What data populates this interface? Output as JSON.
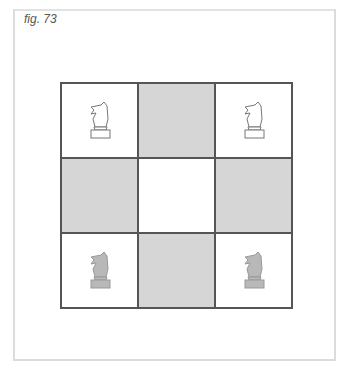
{
  "figure": {
    "caption": "fig. 73"
  },
  "board": {
    "rows": 3,
    "cols": 3,
    "colors": {
      "light": "#ffffff",
      "dark": "#d6d6d6",
      "border": "#555555"
    },
    "cells": [
      [
        {
          "shade": "light",
          "piece": "white-knight"
        },
        {
          "shade": "dark",
          "piece": null
        },
        {
          "shade": "light",
          "piece": "white-knight"
        }
      ],
      [
        {
          "shade": "dark",
          "piece": null
        },
        {
          "shade": "light",
          "piece": null
        },
        {
          "shade": "dark",
          "piece": null
        }
      ],
      [
        {
          "shade": "light",
          "piece": "black-knight"
        },
        {
          "shade": "dark",
          "piece": null
        },
        {
          "shade": "light",
          "piece": "black-knight"
        }
      ]
    ]
  }
}
